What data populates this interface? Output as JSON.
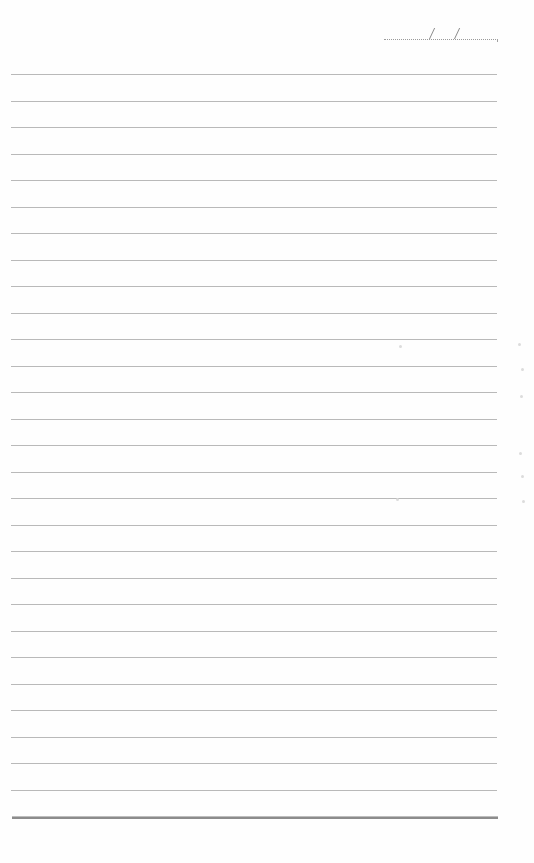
{
  "page": {
    "type": "ruled-notebook-page",
    "background_color": "#fefefe",
    "line_color": "#b9b9b9",
    "bottom_rule_color": "#8c8c8c"
  },
  "date_field": {
    "value": "",
    "separators": [
      "/",
      "/"
    ]
  },
  "lines": {
    "count": 28,
    "first_y": 74,
    "spacing": 26.5,
    "bottom_rule_y": 816,
    "content": [
      "",
      "",
      "",
      "",
      "",
      "",
      "",
      "",
      "",
      "",
      "",
      "",
      "",
      "",
      "",
      "",
      "",
      "",
      "",
      "",
      "",
      "",
      "",
      "",
      "",
      "",
      "",
      ""
    ]
  },
  "bleed_marks": [
    {
      "x": 518,
      "y": 343
    },
    {
      "x": 521,
      "y": 368
    },
    {
      "x": 520,
      "y": 395
    },
    {
      "x": 519,
      "y": 452
    },
    {
      "x": 521,
      "y": 475
    },
    {
      "x": 522,
      "y": 500
    },
    {
      "x": 399,
      "y": 345
    },
    {
      "x": 396,
      "y": 498
    }
  ]
}
